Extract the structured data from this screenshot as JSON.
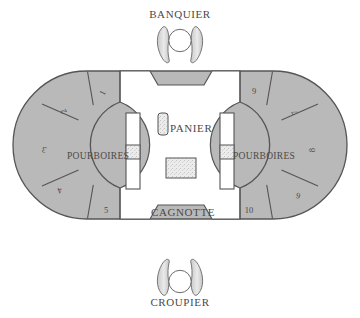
{
  "diagram": {
    "banquier": {
      "label": "BANQUIER",
      "icon": "banker-figure-icon"
    },
    "croupier": {
      "label": "CROUPIER",
      "icon": "croupier-figure-icon"
    },
    "center": {
      "panier_label": "PANIER",
      "cagnotte_label": "CAGNOTTE"
    },
    "pourboires": {
      "left_label": "POURBOIRES",
      "right_label": "POURBOIRES"
    },
    "seats": [
      {
        "number": "1",
        "side": "left",
        "rotation": -62
      },
      {
        "number": "2",
        "side": "left",
        "rotation": -118
      },
      {
        "number": "3",
        "side": "left",
        "rotation": -162
      },
      {
        "number": "4",
        "side": "left",
        "rotation": 162
      },
      {
        "number": "5",
        "side": "left",
        "rotation": 118
      },
      {
        "number": "6",
        "side": "right",
        "rotation": -162
      },
      {
        "number": "7",
        "side": "right",
        "rotation": -118
      },
      {
        "number": "8",
        "side": "right",
        "rotation": -90
      },
      {
        "number": "9",
        "side": "right",
        "rotation": 0
      },
      {
        "number": "10",
        "side": "right",
        "rotation": 0
      }
    ],
    "colors": {
      "seat_fill": "#b9b9b9",
      "seat_stroke": "#5a5a5a",
      "table_fill": "#ffffff",
      "outline": "#555555",
      "speckle_fill": "#e2e2e2",
      "text": "#4a4a4a",
      "background": "#ffffff"
    }
  }
}
